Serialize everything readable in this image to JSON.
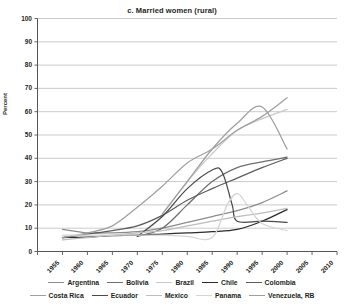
{
  "chart_data": {
    "type": "line",
    "title": "c. Married women (rural)",
    "xlabel": "",
    "ylabel": "Percent",
    "xlim": [
      1955,
      2015
    ],
    "ylim": [
      0,
      100
    ],
    "grid": true,
    "legend_position": "bottom",
    "x_ticks": [
      "1955",
      "1960",
      "1965",
      "1970",
      "1975",
      "1980",
      "1985",
      "1990",
      "1995",
      "2000",
      "2005",
      "2010",
      "2015"
    ],
    "y_ticks": [
      "0",
      "10",
      "20",
      "30",
      "40",
      "50",
      "60",
      "70",
      "80",
      "90",
      "100"
    ],
    "series": [
      {
        "name": "Argentina",
        "color": "#8c8c8c",
        "points": [
          [
            1960,
            9.5
          ],
          [
            1965,
            8.0
          ],
          [
            1970,
            8.0
          ],
          [
            1975,
            8.5
          ],
          [
            1980,
            10.0
          ],
          [
            1985,
            12.5
          ],
          [
            1990,
            15.0
          ],
          [
            1995,
            17.5
          ],
          [
            2000,
            21.0
          ],
          [
            2005,
            26.0
          ]
        ]
      },
      {
        "name": "Bolivia",
        "color": "#6e6e6e",
        "points": [
          [
            1975,
            6.5
          ],
          [
            1980,
            10.0
          ],
          [
            1985,
            20.0
          ],
          [
            1990,
            30.0
          ],
          [
            1995,
            36.0
          ],
          [
            2000,
            38.5
          ],
          [
            2005,
            40.5
          ]
        ]
      },
      {
        "name": "Brazil",
        "color": "#c9c9c9",
        "points": [
          [
            1980,
            16.0
          ],
          [
            1985,
            30.0
          ],
          [
            1990,
            42.0
          ],
          [
            1995,
            52.0
          ],
          [
            2000,
            57.0
          ],
          [
            2005,
            61.0
          ]
        ]
      },
      {
        "name": "Chile",
        "color": "#2b2b2b",
        "points": [
          [
            1960,
            6.0
          ],
          [
            1965,
            6.2
          ],
          [
            1970,
            6.8
          ],
          [
            1975,
            7.0
          ],
          [
            1980,
            7.5
          ],
          [
            1985,
            8.0
          ],
          [
            1990,
            8.5
          ],
          [
            1995,
            9.5
          ],
          [
            2000,
            13.0
          ],
          [
            2005,
            18.0
          ]
        ]
      },
      {
        "name": "Colombia",
        "color": "#5c5c5c",
        "points": [
          [
            1960,
            6.0
          ],
          [
            1965,
            7.5
          ],
          [
            1970,
            9.0
          ],
          [
            1975,
            11.0
          ],
          [
            1980,
            15.5
          ],
          [
            1985,
            22.0
          ],
          [
            1990,
            27.0
          ],
          [
            1995,
            31.5
          ],
          [
            2000,
            36.0
          ],
          [
            2005,
            40.0
          ]
        ]
      },
      {
        "name": "Costa Rica",
        "color": "#a0a0a0",
        "points": [
          [
            1960,
            6.0
          ],
          [
            1965,
            8.0
          ],
          [
            1970,
            11.0
          ],
          [
            1975,
            19.0
          ],
          [
            1980,
            28.0
          ],
          [
            1985,
            38.0
          ],
          [
            1990,
            44.0
          ],
          [
            1995,
            52.0
          ],
          [
            2000,
            58.0
          ],
          [
            2005,
            66.0
          ]
        ]
      },
      {
        "name": "Ecuador",
        "color": "#4a4a4a",
        "points": [
          [
            1975,
            6.5
          ],
          [
            1980,
            15.0
          ],
          [
            1985,
            27.0
          ],
          [
            1990,
            35.0
          ],
          [
            1992,
            34.0
          ],
          [
            1994,
            20.0
          ],
          [
            1995,
            13.0
          ],
          [
            2000,
            13.0
          ],
          [
            2005,
            12.5
          ]
        ]
      },
      {
        "name": "Mexico",
        "color": "#bdbdbd",
        "points": [
          [
            1960,
            5.0
          ],
          [
            1965,
            6.0
          ],
          [
            1970,
            7.0
          ],
          [
            1975,
            8.0
          ],
          [
            1980,
            9.0
          ],
          [
            1985,
            11.0
          ],
          [
            1990,
            13.0
          ],
          [
            1995,
            15.0
          ],
          [
            2000,
            16.5
          ],
          [
            2005,
            18.5
          ]
        ]
      },
      {
        "name": "Panama",
        "color": "#d4d4d4",
        "points": [
          [
            1960,
            7.0
          ],
          [
            1965,
            7.0
          ],
          [
            1970,
            7.0
          ],
          [
            1975,
            7.0
          ],
          [
            1980,
            7.0
          ],
          [
            1985,
            6.5
          ],
          [
            1990,
            6.0
          ],
          [
            1993,
            20.0
          ],
          [
            1995,
            25.0
          ],
          [
            1997,
            20.0
          ],
          [
            2000,
            12.0
          ],
          [
            2005,
            9.0
          ]
        ]
      },
      {
        "name": "Venezuela, RB",
        "color": "#9e9e9e",
        "points": [
          [
            1980,
            16.0
          ],
          [
            1985,
            30.0
          ],
          [
            1990,
            44.0
          ],
          [
            1995,
            55.0
          ],
          [
            2000,
            62.0
          ],
          [
            2005,
            44.0
          ]
        ]
      }
    ]
  },
  "legend": {
    "rows": [
      [
        {
          "label": "Argentina",
          "color": "#8c8c8c"
        },
        {
          "label": "Bolivia",
          "color": "#6e6e6e"
        },
        {
          "label": "Brazil",
          "color": "#c9c9c9"
        },
        {
          "label": "Chile",
          "color": "#2b2b2b"
        },
        {
          "label": "Colombia",
          "color": "#5c5c5c"
        }
      ],
      [
        {
          "label": "Costa Rica",
          "color": "#a0a0a0"
        },
        {
          "label": "Ecuador",
          "color": "#4a4a4a"
        },
        {
          "label": "Mexico",
          "color": "#bdbdbd"
        },
        {
          "label": "Panama",
          "color": "#d4d4d4"
        },
        {
          "label": "Venezuela, RB",
          "color": "#9e9e9e"
        }
      ]
    ]
  },
  "axes": {
    "y_title": "Percent"
  },
  "colors": {
    "grid": "#b5b5b5",
    "axis": "#555555",
    "text": "#231f20"
  }
}
